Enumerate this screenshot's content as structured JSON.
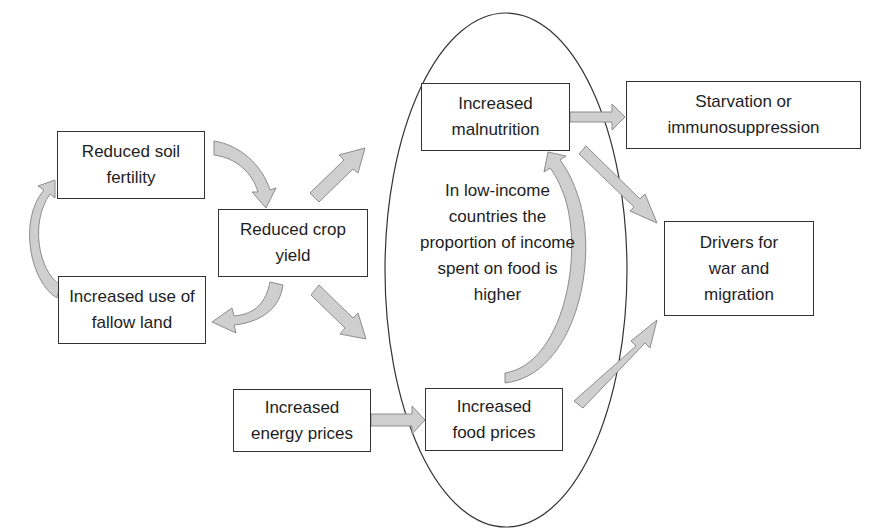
{
  "diagram": {
    "type": "causal-flow",
    "colors": {
      "arrow_fill": "#cfcfcf",
      "arrow_stroke": "#8c8c8c",
      "box_border": "#333333",
      "text": "#1e1e1e"
    },
    "nodes": {
      "soil_fertility": {
        "label": "Reduced soil fertility"
      },
      "fallow_land": {
        "label": "Increased use of fallow land"
      },
      "crop_yield": {
        "label": "Reduced crop yield"
      },
      "malnutrition": {
        "label": "Increased malnutrition"
      },
      "starvation": {
        "label": "Starvation or immunosuppression"
      },
      "drivers": {
        "label": "Drivers for war and migration"
      },
      "energy_prices": {
        "label": "Increased energy prices"
      },
      "food_prices": {
        "label": "Increased food prices"
      }
    },
    "ellipse_note": {
      "label": "In low-income countries the proportion of income spent on food is higher"
    },
    "edges": [
      {
        "from": "fallow_land",
        "to": "soil_fertility",
        "style": "curved"
      },
      {
        "from": "soil_fertility",
        "to": "crop_yield",
        "style": "curved"
      },
      {
        "from": "crop_yield",
        "to": "fallow_land",
        "style": "curved"
      },
      {
        "from": "crop_yield",
        "to": "malnutrition",
        "style": "straight"
      },
      {
        "from": "crop_yield",
        "to": "food_prices",
        "style": "straight"
      },
      {
        "from": "energy_prices",
        "to": "food_prices",
        "style": "straight"
      },
      {
        "from": "food_prices",
        "to": "malnutrition",
        "style": "curved"
      },
      {
        "from": "malnutrition",
        "to": "starvation",
        "style": "straight"
      },
      {
        "from": "malnutrition",
        "to": "drivers",
        "style": "straight"
      },
      {
        "from": "food_prices",
        "to": "drivers",
        "style": "straight"
      }
    ]
  }
}
